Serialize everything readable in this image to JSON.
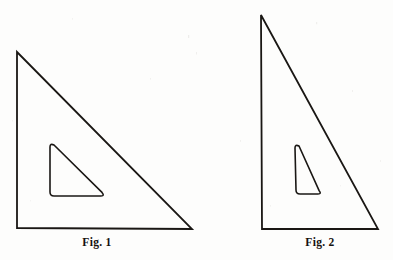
{
  "plate": {
    "background_color": "#fdfdfc",
    "ink_color": "#1a1714",
    "width": 393,
    "height": 260,
    "description": "Line drawing of two draughtsman set squares, each a right triangle with a smaller triangular cut-out window"
  },
  "figures": [
    {
      "id": "figure-1",
      "caption": "Fig. 1",
      "shape_name": "45-degree set square",
      "outer_triangle": {
        "vertices": [
          {
            "label": "apex",
            "x": 17,
            "y": 52
          },
          {
            "label": "bottom-left",
            "x": 17,
            "y": 228
          },
          {
            "label": "bottom-right",
            "x": 192,
            "y": 229
          }
        ],
        "stroke_width": 1.8
      },
      "inner_cutout": {
        "vertices": [
          {
            "label": "top",
            "x": 50,
            "y": 143
          },
          {
            "label": "bottom-left",
            "x": 50,
            "y": 196
          },
          {
            "label": "bottom-right",
            "x": 105,
            "y": 196
          }
        ],
        "corner_radius": 4,
        "stroke_width": 1.6
      }
    },
    {
      "id": "figure-2",
      "caption": "Fig. 2",
      "shape_name": "60-degree set square",
      "outer_triangle": {
        "vertices": [
          {
            "label": "apex",
            "x": 61,
            "y": 15
          },
          {
            "label": "bottom-left",
            "x": 62,
            "y": 229
          },
          {
            "label": "bottom-right",
            "x": 178,
            "y": 229
          }
        ],
        "stroke_width": 1.8
      },
      "inner_cutout": {
        "vertices": [
          {
            "label": "top",
            "x": 95,
            "y": 144
          },
          {
            "label": "bottom-left",
            "x": 96,
            "y": 194
          },
          {
            "label": "bottom-right",
            "x": 122,
            "y": 194
          }
        ],
        "corner_radius": 4,
        "stroke_width": 1.6
      }
    }
  ]
}
